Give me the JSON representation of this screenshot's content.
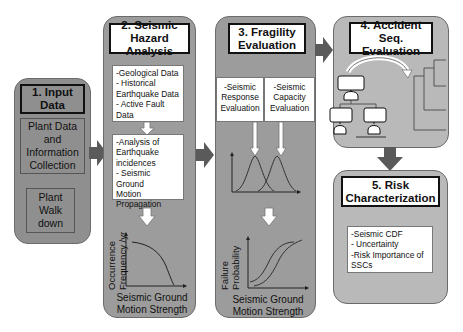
{
  "panels": {
    "input": {
      "title_line1": "1. Input",
      "title_line2": "Data",
      "item1_line1": "Plant Data",
      "item1_line2": "and",
      "item1_line3": "Information",
      "item1_line4": "Collection",
      "item2_line1": "Plant",
      "item2_line2": "Walk",
      "item2_line3": "down"
    },
    "hazard": {
      "title_line1": "2. Seismic",
      "title_line2": "Hazard Analysis",
      "box1": [
        "-Geological Data",
        "- Historical",
        "Earthquake Data",
        "- Active Fault",
        "Data"
      ],
      "box2": [
        "-Analysis of",
        "Earthquake",
        "incidences",
        "- Seismic Ground",
        "Motion",
        "Propagation"
      ],
      "chart": {
        "ylabel_line1": "Occurrence",
        "ylabel_line2": "Frequency /yr",
        "xlabel_line1": "Seismic Ground",
        "xlabel_line2": "Motion Strength"
      }
    },
    "fragility": {
      "title_line1": "3. Fragility",
      "title_line2": "Evaluation",
      "box_left": [
        "-Seismic",
        "Response",
        "Evaluation"
      ],
      "box_right": [
        "-Seismic",
        "Capacity",
        "Evaluation"
      ],
      "chart": {
        "ylabel_line1": "Failure",
        "ylabel_line2": "Probability",
        "xlabel_line1": "Seismic Ground",
        "xlabel_line2": "Motion Strength"
      }
    },
    "accident": {
      "title_line1": "4. Accident",
      "title_line2": "Seq. Evaluation"
    },
    "risk": {
      "title_line1": "5. Risk",
      "title_line2": "Characterization",
      "box": [
        "-Seismic CDF",
        "- Uncertainty",
        "-Risk Importance of",
        "SSCs"
      ]
    }
  },
  "colors": {
    "panel_dark": "#8f8f8f",
    "panel_mid": "#9c9c9c",
    "panel_light": "#b9b9b9",
    "arrow": "#5a5a5a",
    "border": "#6b6b6b"
  }
}
